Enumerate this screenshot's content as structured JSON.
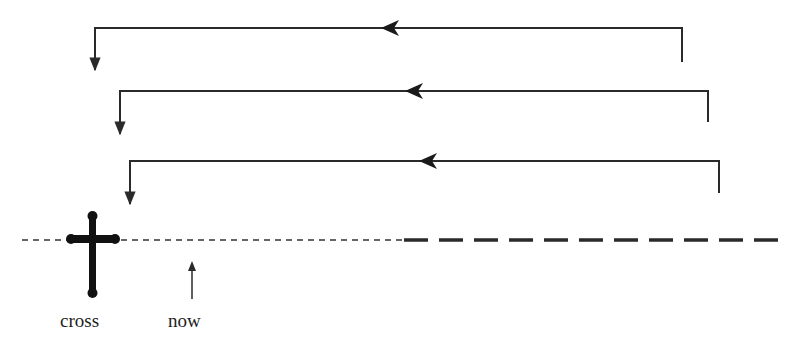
{
  "diagram": {
    "stroke_color": "#2a2a2a",
    "labels": {
      "cross": "cross",
      "now": "now"
    },
    "loops": [
      {
        "left_x": 95,
        "right_x": 682,
        "top_y": 28,
        "right_bottom_y": 62,
        "left_bottom_y": 73,
        "arrow_x": 383
      },
      {
        "left_x": 120,
        "right_x": 708,
        "top_y": 91,
        "right_bottom_y": 122,
        "left_bottom_y": 137,
        "arrow_x": 407
      },
      {
        "left_x": 130,
        "right_x": 719,
        "top_y": 161,
        "right_bottom_y": 193,
        "left_bottom_y": 207,
        "arrow_x": 421
      }
    ],
    "timeline": {
      "y": 240,
      "fine_dash_from": 0,
      "fine_dash_to": 402,
      "bold_dash_from": 402,
      "bold_dash_to": 780
    },
    "icons": [
      "cross-icon",
      "up-arrow-icon"
    ]
  }
}
